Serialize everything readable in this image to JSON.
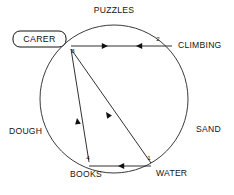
{
  "diagram": {
    "type": "node-link-circle",
    "title_label": "CARER",
    "canvas": {
      "width": 234,
      "height": 195
    },
    "circle": {
      "cx": 114,
      "cy": 99,
      "r": 74
    },
    "nodes": [
      {
        "id": "1",
        "number": "1",
        "label": "WATER",
        "x": 152,
        "y": 163,
        "num_x": 149,
        "num_y": 160,
        "label_x": 156,
        "label_y": 176,
        "label_anchor": "start"
      },
      {
        "id": "2",
        "number": "2",
        "label": "CLIMBING",
        "x": 162,
        "y": 44,
        "num_x": 158,
        "num_y": 41,
        "label_x": 178,
        "label_y": 48,
        "label_anchor": "start"
      },
      {
        "id": "3",
        "number": "3",
        "label": "CARER",
        "x": 70,
        "y": 48,
        "num_x": 73,
        "num_y": 53,
        "label_x": 0,
        "label_y": 0,
        "label_anchor": "start"
      },
      {
        "id": "4",
        "number": "4",
        "label": "BOOKS",
        "x": 88,
        "y": 163,
        "num_x": 88,
        "num_y": 160,
        "label_x": 86,
        "label_y": 177,
        "label_anchor": "middle"
      }
    ],
    "arc_labels": [
      {
        "text": "PUZZLES",
        "x": 114,
        "y": 13,
        "anchor": "middle"
      },
      {
        "text": "SAND",
        "x": 196,
        "y": 132,
        "anchor": "start"
      },
      {
        "text": "DOUGH",
        "x": 9,
        "y": 134,
        "anchor": "start"
      }
    ],
    "edges": [
      {
        "id": "e-3-2",
        "from": "3",
        "to": "2",
        "x1": 71,
        "y1": 46,
        "x2": 172,
        "y2": 46,
        "arrows": [
          {
            "x": 108,
            "y": 46,
            "angle": 0,
            "name": "arrowhead-right"
          },
          {
            "x": 136,
            "y": 46,
            "angle": 180,
            "name": "arrowhead-left"
          }
        ]
      },
      {
        "id": "e-1-3",
        "from": "1",
        "to": "3",
        "x1": 151,
        "y1": 163,
        "x2": 71,
        "y2": 49,
        "arrows": [
          {
            "x": 106,
            "y": 112,
            "angle": 234.9,
            "name": "arrowhead-upleft"
          }
        ]
      },
      {
        "id": "e-4-3",
        "from": "4",
        "to": "3",
        "x1": 89,
        "y1": 162,
        "x2": 71,
        "y2": 49,
        "arrows": [
          {
            "x": 77,
            "y": 118,
            "angle": 260.9,
            "name": "arrowhead-up"
          }
        ]
      },
      {
        "id": "e-1-4",
        "from": "1",
        "to": "4",
        "x1": 151,
        "y1": 166,
        "x2": 89,
        "y2": 166,
        "arrows": [
          {
            "x": 118,
            "y": 166,
            "angle": 180,
            "name": "arrowhead-left"
          }
        ]
      }
    ],
    "carer_box": {
      "x": 13,
      "y": 31,
      "width": 53,
      "height": 16,
      "rx": 7,
      "text_x": 39.5,
      "text_y": 42.4
    }
  }
}
